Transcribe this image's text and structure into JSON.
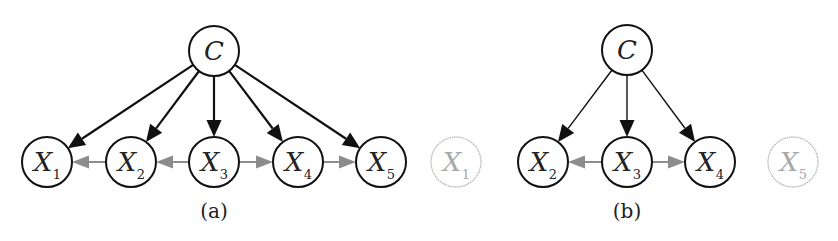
{
  "figure": {
    "panels": [
      {
        "id": "a",
        "caption": "(a)",
        "caption_pos": [
          214,
          218
        ],
        "root": {
          "label": "C",
          "x": 214,
          "y": 51
        },
        "nodes": [
          {
            "label": "X",
            "sub": "1",
            "x": 47,
            "y": 162,
            "faded": false
          },
          {
            "label": "X",
            "sub": "2",
            "x": 131,
            "y": 162,
            "faded": false
          },
          {
            "label": "X",
            "sub": "3",
            "x": 214,
            "y": 162,
            "faded": false
          },
          {
            "label": "X",
            "sub": "4",
            "x": 298,
            "y": 162,
            "faded": false
          },
          {
            "label": "X",
            "sub": "5",
            "x": 381,
            "y": 162,
            "faded": false
          }
        ],
        "root_edges": [
          0,
          1,
          2,
          3,
          4
        ],
        "lateral_edges": [
          {
            "from": 1,
            "to": 0
          },
          {
            "from": 2,
            "to": 1
          },
          {
            "from": 2,
            "to": 3
          },
          {
            "from": 3,
            "to": 4
          }
        ],
        "edge_width": 2.2
      },
      {
        "id": "b",
        "caption": "(b)",
        "caption_pos": [
          627,
          218
        ],
        "root": {
          "label": "C",
          "x": 627,
          "y": 50
        },
        "nodes": [
          {
            "label": "X",
            "sub": "1",
            "x": 456,
            "y": 162,
            "faded": true
          },
          {
            "label": "X",
            "sub": "2",
            "x": 543,
            "y": 162,
            "faded": false
          },
          {
            "label": "X",
            "sub": "3",
            "x": 627,
            "y": 162,
            "faded": false
          },
          {
            "label": "X",
            "sub": "4",
            "x": 710,
            "y": 162,
            "faded": false
          },
          {
            "label": "X",
            "sub": "5",
            "x": 793,
            "y": 162,
            "faded": true
          }
        ],
        "root_edges": [
          1,
          2,
          3
        ],
        "lateral_edges": [
          {
            "from": 2,
            "to": 1
          },
          {
            "from": 2,
            "to": 3
          }
        ],
        "edge_width": 1.4
      }
    ],
    "colors": {
      "node_stroke": "#111111",
      "faded_stroke": "#b5b5b5",
      "faded_text": "#a8a8a8",
      "root_arrow": "#111111",
      "lateral_arrow": "#8c8c8c",
      "text": "#222222"
    },
    "node_radius": 25
  }
}
